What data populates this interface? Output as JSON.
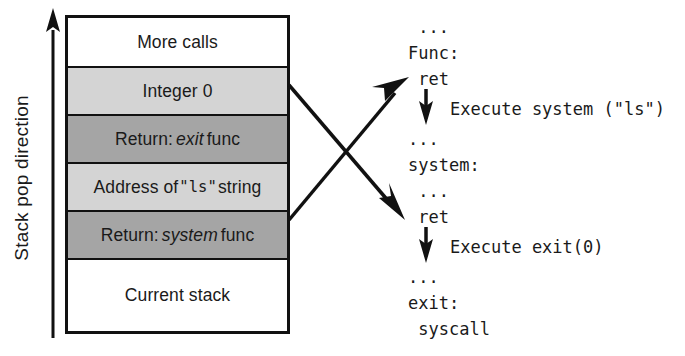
{
  "figure": {
    "axis": {
      "label": "Stack pop direction",
      "arrow_icon": "up-arrow-icon",
      "direction": "up"
    },
    "stack": {
      "name": "call-stack",
      "rows": [
        {
          "label": "More calls",
          "fill": "white",
          "emphasis": "none"
        },
        {
          "label": "Integer 0",
          "fill": "light",
          "emphasis": "none"
        },
        {
          "label": "Return: ",
          "italic": "exit",
          "suffix": " func",
          "fill": "dark",
          "emphasis": "italic-word"
        },
        {
          "label": "Address of ",
          "mono": "\"ls\"",
          "suffix": " string",
          "fill": "light",
          "emphasis": "mono-word"
        },
        {
          "label": "Return: ",
          "italic": "system",
          "suffix": " func",
          "fill": "dark",
          "emphasis": "italic-word"
        },
        {
          "label": "Current stack",
          "fill": "white",
          "emphasis": "none"
        }
      ]
    },
    "connectors": [
      {
        "name": "exit-return-connector",
        "from_row": "Return: exit func",
        "to_line": "ret (under system:)",
        "icon": "arrow-down-right-icon"
      },
      {
        "name": "system-return-connector",
        "from_row": "Return: system func",
        "to_line": "ret (under Func:)",
        "icon": "arrow-up-right-icon"
      }
    ],
    "code": {
      "name": "execution-trace",
      "blocks": [
        {
          "lines": [
            " ...",
            "Func:",
            " ret"
          ],
          "exec": {
            "text": "Execute system (\"ls\")",
            "arrow_icon": "down-arrow-icon"
          }
        },
        {
          "lines": [
            "...",
            "system:",
            " ..."
          ],
          "exec": null
        },
        {
          "lines": [
            " ret"
          ],
          "exec": {
            "text": "Execute exit(0)",
            "arrow_icon": "down-arrow-icon"
          }
        },
        {
          "lines": [
            "...",
            "exit:",
            " syscall"
          ],
          "exec": null
        }
      ]
    },
    "colors": {
      "stroke": "#111111",
      "fill_light": "#d4d4d4",
      "fill_dark": "#a5a5a5",
      "background": "#ffffff"
    }
  }
}
